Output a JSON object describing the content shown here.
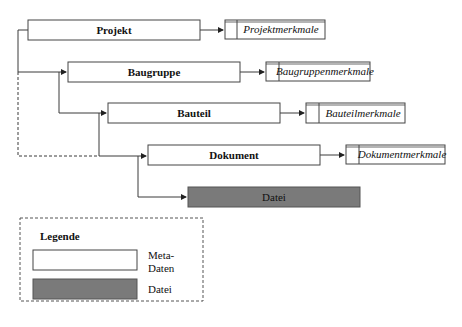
{
  "diagram": {
    "nodes": [
      {
        "id": "projekt",
        "label": "Projekt",
        "type": "meta",
        "attribute": "Projektmerkmale"
      },
      {
        "id": "baugruppe",
        "label": "Baugruppe",
        "type": "meta",
        "attribute": "Baugruppenmerkmale"
      },
      {
        "id": "bauteil",
        "label": "Bauteil",
        "type": "meta",
        "attribute": "Bauteilmerkmale"
      },
      {
        "id": "dokument",
        "label": "Dokument",
        "type": "meta",
        "attribute": "Dokumentmerkmale"
      },
      {
        "id": "datei",
        "label": "Datei",
        "type": "file"
      }
    ],
    "edges": [
      {
        "from": "projekt",
        "to": "projekt_attr",
        "style": "solid"
      },
      {
        "from": "projekt",
        "to": "baugruppe",
        "style": "solid"
      },
      {
        "from": "baugruppe",
        "to": "baugruppe_attr",
        "style": "solid"
      },
      {
        "from": "baugruppe",
        "to": "bauteil",
        "style": "solid"
      },
      {
        "from": "bauteil",
        "to": "bauteil_attr",
        "style": "solid"
      },
      {
        "from": "bauteil",
        "to": "dokument",
        "style": "solid"
      },
      {
        "from": "projekt",
        "to": "dokument",
        "style": "dashed"
      },
      {
        "from": "dokument",
        "to": "dokument_attr",
        "style": "solid"
      },
      {
        "from": "dokument",
        "to": "datei",
        "style": "solid"
      }
    ]
  },
  "legend": {
    "title": "Legende",
    "items": [
      {
        "label_line1": "Meta-",
        "label_line2": "Daten",
        "swatch": "white"
      },
      {
        "label_line1": "Datei",
        "swatch": "gray"
      }
    ]
  },
  "colors": {
    "line": "#3a3a3a",
    "file_fill": "#7a7a7a",
    "meta_fill": "#ffffff"
  }
}
